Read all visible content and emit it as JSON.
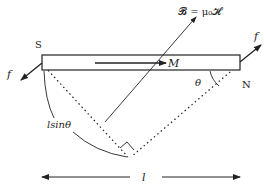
{
  "diagram": {
    "labels": {
      "field": "𝓑 = μ₀𝓗",
      "magnetization": "M",
      "south_pole": "S",
      "north_pole": "N",
      "force_left": "f",
      "force_right": "f",
      "angle": "θ",
      "moment_arm": "lsinθ",
      "length": "l"
    },
    "colors": {
      "stroke": "#222222",
      "bar_fill": "#ffffff",
      "background": "#ffffff"
    }
  }
}
